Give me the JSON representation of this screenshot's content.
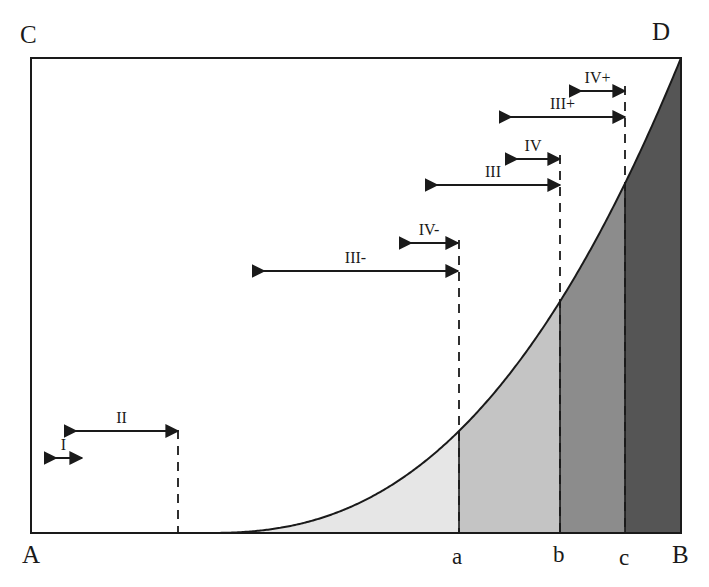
{
  "figure": {
    "frame": {
      "x0": 31,
      "y0": 58,
      "x1": 681,
      "y1": 533,
      "stroke": "#1a1a1a"
    },
    "corner_labels": [
      {
        "name": "corner-label-c",
        "text": "C",
        "x": 20,
        "y": 22
      },
      {
        "name": "corner-label-d",
        "text": "D",
        "x": 652,
        "y": 19
      },
      {
        "name": "corner-label-a",
        "text": "A",
        "x": 22,
        "y": 542
      },
      {
        "name": "corner-label-b",
        "text": "B",
        "x": 672,
        "y": 542
      }
    ],
    "axis_labels": [
      {
        "name": "axis-label-a-lower",
        "text": "a",
        "x": 452,
        "y": 545
      },
      {
        "name": "axis-label-b-lower",
        "text": "b",
        "x": 553,
        "y": 543
      },
      {
        "name": "axis-label-c-lower",
        "text": "c",
        "x": 619,
        "y": 546
      }
    ],
    "dashed_lines": [
      {
        "name": "dashed-line-start",
        "x": 178,
        "y_top": 430,
        "y_bottom": 533
      },
      {
        "name": "dashed-line-a",
        "x": 459,
        "y_top": 240,
        "y_bottom": 533
      },
      {
        "name": "dashed-line-b",
        "x": 560,
        "y_top": 155,
        "y_bottom": 533
      },
      {
        "name": "dashed-line-c",
        "x": 625,
        "y_top": 86,
        "y_bottom": 533
      }
    ],
    "span_arrows": [
      {
        "name": "span-arrow-iv-plus",
        "label": "IV+",
        "x_start": 570,
        "x_end": 625,
        "y": 91,
        "label_y": 70,
        "heads": "both"
      },
      {
        "name": "span-arrow-iii-plus",
        "label": "III+",
        "x_start": 500,
        "x_end": 625,
        "y": 117,
        "label_y": 96,
        "heads": "both"
      },
      {
        "name": "span-arrow-iv",
        "label": "IV",
        "x_start": 506,
        "x_end": 560,
        "y": 159,
        "label_y": 138,
        "heads": "both"
      },
      {
        "name": "span-arrow-iii",
        "label": "III",
        "x_start": 426,
        "x_end": 560,
        "y": 185,
        "label_y": 164,
        "heads": "both"
      },
      {
        "name": "span-arrow-iv-minus",
        "label": "IV-",
        "x_start": 400,
        "x_end": 458,
        "y": 243,
        "label_y": 222,
        "heads": "both"
      },
      {
        "name": "span-arrow-iii-minus",
        "label": "III-",
        "x_start": 253,
        "x_end": 458,
        "y": 271,
        "label_y": 250,
        "heads": "both"
      },
      {
        "name": "span-arrow-ii",
        "label": "II",
        "x_start": 65,
        "x_end": 178,
        "y": 431,
        "label_y": 410,
        "heads": "both"
      },
      {
        "name": "span-arrow-i",
        "label": "I",
        "x_start": 45,
        "x_end": 82,
        "y": 458,
        "label_y": 437,
        "heads": "both"
      }
    ],
    "curve": {
      "name": "exponential-curve",
      "description": "convex increasing curve from baseline near A to corner D",
      "baseline_y": 533,
      "start_x": 205,
      "end_x": 681,
      "end_y": 58,
      "stroke": "#1a1a1a"
    },
    "shaded_regions": [
      {
        "name": "region-under-curve-to-a",
        "from_x": 205,
        "to_x": 459,
        "fill": "#e6e6e6"
      },
      {
        "name": "region-a-to-b",
        "from_x": 459,
        "to_x": 560,
        "fill": "#c4c4c4"
      },
      {
        "name": "region-b-to-c",
        "from_x": 560,
        "to_x": 625,
        "fill": "#8c8c8c"
      },
      {
        "name": "region-c-to-b-end",
        "from_x": 625,
        "to_x": 681,
        "fill": "#555555"
      }
    ]
  }
}
